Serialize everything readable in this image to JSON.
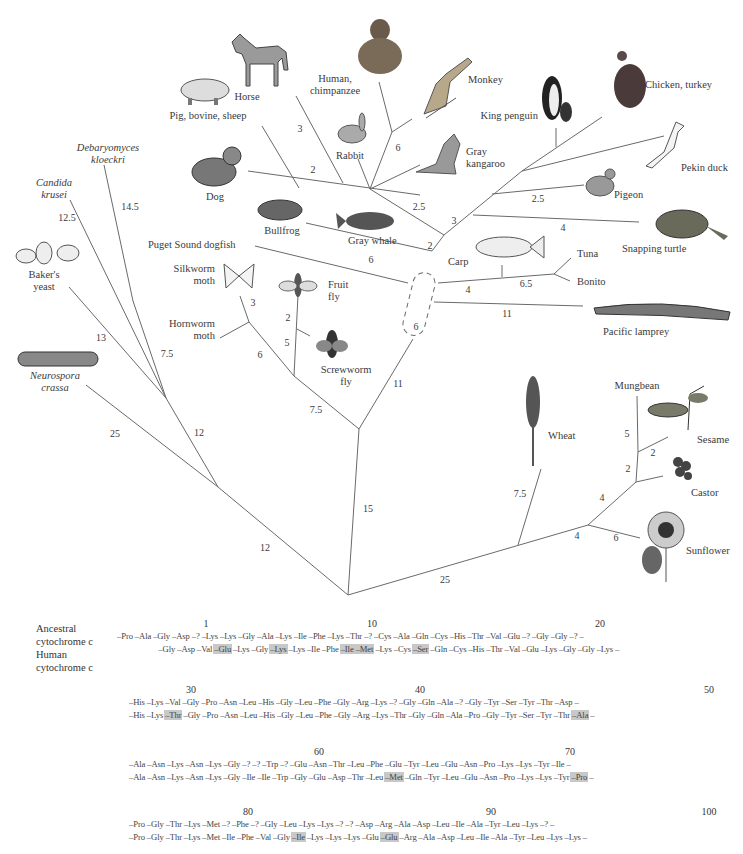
{
  "figure": {
    "type": "phylogenetic-tree"
  },
  "organisms": {
    "horse": "Horse",
    "human_chimp_1": "Human,",
    "human_chimp_2": "chimpanzee",
    "monkey": "Monkey",
    "pig_1": "Pig, bovine, sheep",
    "rabbit": "Rabbit",
    "kangaroo_1": "Gray",
    "kangaroo_2": "kangaroo",
    "king_penguin": "King penguin",
    "chicken": "Chicken, turkey",
    "pekin_duck": "Pekin duck",
    "pigeon": "Pigeon",
    "snapping_turtle": "Snapping turtle",
    "debaryomyces_1": "Debaryomyces",
    "debaryomyces_2": "kloeckri",
    "candida_1": "Candida",
    "candida_2": "krusei",
    "dog": "Dog",
    "bullfrog": "Bullfrog",
    "gray_whale": "Gray whale",
    "dogfish": "Puget Sound dogfish",
    "carp": "Carp",
    "tuna": "Tuna",
    "bonito": "Bonito",
    "lamprey": "Pacific lamprey",
    "bakers_yeast_1": "Baker's",
    "bakers_yeast_2": "yeast",
    "silkworm_1": "Silkworm",
    "silkworm_2": "moth",
    "fruit_fly_1": "Fruit",
    "fruit_fly_2": "fly",
    "hornworm_1": "Hornworm",
    "hornworm_2": "moth",
    "screwworm_1": "Screwworm",
    "screwworm_2": "fly",
    "neurospora_1": "Neurospora",
    "neurospora_2": "crassa",
    "wheat": "Wheat",
    "mungbean": "Mungbean",
    "sesame": "Sesame",
    "castor": "Castor",
    "sunflower": "Sunflower"
  },
  "branch_lengths": {
    "horse": "3",
    "pig": "2",
    "monkey": "6",
    "mammal_stem": "2.5",
    "pigeon": "2.5",
    "bird_stem": "3",
    "turtle": "4",
    "tetrapod_stem": "2",
    "whale_frog": "6",
    "debaryomyces": "14.5",
    "candida": "12.5",
    "bakers_yeast": "13",
    "yeast_inner": "7.5",
    "fungi_stem": "12",
    "neurospora": "25",
    "fungi_root": "12",
    "silkworm": "3",
    "fruit_fly": "2",
    "screwworm": "5",
    "hornworm": "6",
    "insect_stem": "7.5",
    "carp_stem": "4",
    "tuna_bonito": "6.5",
    "lamprey": "11",
    "vertebrate_box": "6",
    "animal_stem": "11",
    "animal_root": "15",
    "mungbean": "5",
    "sesame": "2",
    "castor_node": "2",
    "castor_stem": "4",
    "sunflower_stem": "4",
    "sunflower": "6",
    "wheat": "7.5",
    "plant_root": "25"
  },
  "sequence": {
    "label_ancestral_1": "Ancestral",
    "label_ancestral_2": "cytochrome c",
    "label_human_1": "Human",
    "label_human_2": "cytochrome c",
    "blocks": [
      {
        "positions": [
          {
            "n": "1",
            "x": 206
          },
          {
            "n": "10",
            "x": 372
          },
          {
            "n": "20",
            "x": 600
          }
        ],
        "ancestral": [
          "Pro",
          "Ala",
          "Gly",
          "Asp",
          "?",
          "Lys",
          "Lys",
          "Gly",
          "Ala",
          "Lys",
          "Ile",
          "Phe",
          "Lys",
          "Thr",
          "?",
          "Cys",
          "Ala",
          "Gln",
          "Cys",
          "His",
          "Thr",
          "Val",
          "Glu",
          "?",
          "Gly",
          "Gly",
          "?"
        ],
        "human": [
          "",
          "",
          "Gly",
          "Asp",
          "Val",
          "Glu",
          "Lys",
          "Gly",
          "Lys",
          "Lys",
          "Ile",
          "Phe",
          "Ile",
          "Met",
          "Lys",
          "Cys",
          "Ser",
          "Gln",
          "Cys",
          "His",
          "Thr",
          "Val",
          "Glu",
          "Lys",
          "Gly",
          "Gly",
          "Lys"
        ],
        "highlight": [
          5,
          8,
          12,
          13,
          16
        ]
      },
      {
        "positions": [
          {
            "n": "30",
            "x": 191
          },
          {
            "n": "40",
            "x": 420
          },
          {
            "n": "50",
            "x": 709
          }
        ],
        "ancestral": [
          "His",
          "Lys",
          "Val",
          "Gly",
          "Pro",
          "Asn",
          "Leu",
          "His",
          "Gly",
          "Leu",
          "Phe",
          "Gly",
          "Arg",
          "Lys",
          "?",
          "Gly",
          "Gln",
          "Ala",
          "?",
          "Gly",
          "Tyr",
          "Ser",
          "Tyr",
          "Thr",
          "Asp"
        ],
        "human": [
          "His",
          "Lys",
          "Thr",
          "Gly",
          "Pro",
          "Asn",
          "Leu",
          "His",
          "Gly",
          "Leu",
          "Phe",
          "Gly",
          "Arg",
          "Lys",
          "Thr",
          "Gly",
          "Gln",
          "Ala",
          "Pro",
          "Gly",
          "Tyr",
          "Ser",
          "Tyr",
          "Thr",
          "Ala"
        ],
        "highlight": [
          2,
          24
        ]
      },
      {
        "positions": [
          {
            "n": "60",
            "x": 319
          },
          {
            "n": "70",
            "x": 570
          }
        ],
        "ancestral": [
          "Ala",
          "Asn",
          "Lys",
          "Asn",
          "Lys",
          "Gly",
          "?",
          "?",
          "Trp",
          "?",
          "Glu",
          "Asn",
          "Thr",
          "Leu",
          "Phe",
          "Glu",
          "Tyr",
          "Leu",
          "Glu",
          "Asn",
          "Pro",
          "Lys",
          "Lys",
          "Tyr",
          "Ile"
        ],
        "human": [
          "Ala",
          "Asn",
          "Lys",
          "Asn",
          "Lys",
          "Gly",
          "Ile",
          "Ile",
          "Trp",
          "Gly",
          "Glu",
          "Asp",
          "Thr",
          "Leu",
          "Met",
          "Gln",
          "Tyr",
          "Leu",
          "Glu",
          "Asn",
          "Pro",
          "Lys",
          "Lys",
          "Tyr",
          "Pro"
        ],
        "highlight": [
          14,
          24
        ]
      },
      {
        "positions": [
          {
            "n": "80",
            "x": 248
          },
          {
            "n": "90",
            "x": 491
          },
          {
            "n": "100",
            "x": 709
          }
        ],
        "ancestral": [
          "Pro",
          "Gly",
          "Thr",
          "Lys",
          "Met",
          "?",
          "Phe",
          "?",
          "Gly",
          "Leu",
          "Lys",
          "Lys",
          "?",
          "?",
          "Asp",
          "Arg",
          "Ala",
          "Asp",
          "Leu",
          "Ile",
          "Ala",
          "Tyr",
          "Leu",
          "Lys",
          "?"
        ],
        "human": [
          "Pro",
          "Gly",
          "Thr",
          "Lys",
          "Met",
          "Ile",
          "Phe",
          "Val",
          "Gly",
          "Ile",
          "Lys",
          "Lys",
          "Lys",
          "Glu",
          "Glu",
          "Arg",
          "Ala",
          "Asp",
          "Leu",
          "Ile",
          "Ala",
          "Tyr",
          "Leu",
          "Lys",
          "Lys"
        ],
        "highlight": [
          9,
          14
        ]
      }
    ]
  },
  "colors": {
    "line": "#6a6a6a",
    "text": "#3a3a3a",
    "highlight": "#c8c8c8"
  }
}
